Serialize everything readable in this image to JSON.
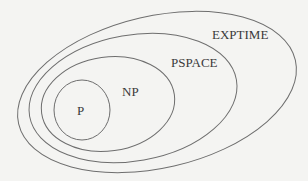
{
  "diagram": {
    "classes": [
      {
        "id": "exptime",
        "label": "EXPTIME",
        "cx": 157,
        "cy": 92,
        "rx": 142,
        "ry": 76,
        "rotate": -13
      },
      {
        "id": "pspace",
        "label": "PSPACE",
        "cx": 133,
        "cy": 98,
        "rx": 105,
        "ry": 63,
        "rotate": -10
      },
      {
        "id": "np",
        "label": "NP",
        "cx": 108,
        "cy": 104,
        "rx": 67,
        "ry": 47,
        "rotate": -8
      },
      {
        "id": "p",
        "label": "P",
        "cx": 82,
        "cy": 110,
        "rx": 28,
        "ry": 30,
        "rotate": 0
      }
    ],
    "labels": {
      "exptime": "EXPTIME",
      "pspace": "PSPACE",
      "np": "NP",
      "p": "P"
    },
    "colors": {
      "stroke": "#6e6e6e",
      "text": "#3a3a3a",
      "background": "#f4f4f2"
    }
  }
}
